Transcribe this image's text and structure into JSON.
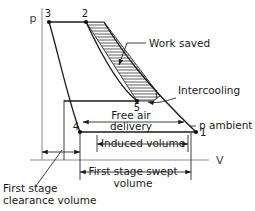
{
  "figure": {
    "type": "thermodynamic-pv-diagram",
    "axes": {
      "y_label": "p",
      "x_label": "V"
    },
    "points": [
      {
        "id": "3",
        "label": "3",
        "x": 49,
        "y": 21
      },
      {
        "id": "2",
        "label": "2",
        "x": 86,
        "y": 22
      },
      {
        "id": "5",
        "label": "5",
        "x": 137,
        "y": 101
      },
      {
        "id": "i",
        "label": "i",
        "x": 153,
        "y": 96
      },
      {
        "id": "4",
        "label": "4",
        "x": 80,
        "y": 132
      },
      {
        "id": "1",
        "label": "1",
        "x": 196,
        "y": 132
      }
    ],
    "annotations": {
      "work_saved": "Work saved",
      "intercooling": "Intercooling",
      "p_ambient": "p ambient",
      "free_air_delivery_line1": "Free air",
      "free_air_delivery_line2": "delivery",
      "induced_volume": "Induced volume",
      "first_stage_swept_line1": "First stage swept",
      "first_stage_swept_line2": "volume",
      "first_stage_clearance_line1": "First stage",
      "first_stage_clearance_line2": "clearance volume"
    },
    "colors": {
      "ink": "#1a1a1a",
      "axis_gray": "#8a8a8a",
      "background": "#ffffff"
    }
  }
}
